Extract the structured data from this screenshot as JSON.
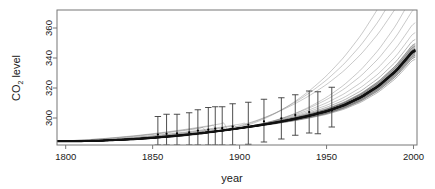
{
  "chart_data": {
    "type": "line",
    "title": "",
    "subtitle": "",
    "xlabel": "year",
    "ylabel": "CO2 level",
    "ylabel_parts": {
      "pre": "CO",
      "sub": "2",
      "post": " level"
    },
    "xlim": [
      1795,
      2002
    ],
    "ylim": [
      282,
      372
    ],
    "grid": false,
    "legend": null,
    "xticks": [
      1800,
      1850,
      1900,
      1950,
      2000
    ],
    "xtick_labels": [
      "1800",
      "1850",
      "1900",
      "1950",
      "2000"
    ],
    "yticks": [
      300,
      320,
      340,
      360
    ],
    "ytick_labels": [
      "300",
      "320",
      "340",
      "360"
    ],
    "colors": {
      "fit_curve": "#111111",
      "posterior_curves": "#7a7a7a",
      "errorbar": "#3a3a3a",
      "axis": "#777777",
      "text": "#1a1a1a",
      "background": "#ffffff"
    },
    "series": [
      {
        "name": "mean trend",
        "style": "thick-black-line",
        "x": [
          1800,
          1810,
          1820,
          1830,
          1840,
          1850,
          1860,
          1870,
          1880,
          1890,
          1900,
          1910,
          1920,
          1930,
          1940,
          1950,
          1960,
          1970,
          1980,
          1990,
          2000
        ],
        "values": [
          284.5,
          284.6,
          284.9,
          285.4,
          286.0,
          286.8,
          287.8,
          288.9,
          290.2,
          291.6,
          293.2,
          294.9,
          296.8,
          299.0,
          301.5,
          304.5,
          308.5,
          314.0,
          321.5,
          331.5,
          345.0
        ]
      },
      {
        "name": "posterior sample curves",
        "style": "thin-grey-lines",
        "count": 18,
        "spread_start_year": 1900,
        "x": [
          1800,
          1850,
          1900,
          1930,
          1950,
          1970,
          1985,
          1995,
          2000
        ],
        "upper_envelope": [
          284.8,
          287.6,
          294.6,
          301.8,
          307.5,
          320.0,
          340.0,
          365.0,
          378.0
        ],
        "lower_envelope": [
          284.2,
          286.2,
          292.4,
          297.8,
          302.8,
          312.0,
          319.5,
          340.0,
          347.0
        ]
      }
    ],
    "errorbars": [
      {
        "year": 1853,
        "value": 289.0,
        "low": 282.0,
        "high": 301.0
      },
      {
        "year": 1858,
        "value": 289.5,
        "low": 282.0,
        "high": 302.5
      },
      {
        "year": 1864,
        "value": 289.8,
        "low": 282.0,
        "high": 302.5
      },
      {
        "year": 1871,
        "value": 290.5,
        "low": 282.0,
        "high": 303.5
      },
      {
        "year": 1876,
        "value": 291.6,
        "low": 282.0,
        "high": 305.5
      },
      {
        "year": 1882,
        "value": 292.2,
        "low": 282.0,
        "high": 307.0
      },
      {
        "year": 1886,
        "value": 292.9,
        "low": 282.0,
        "high": 307.5
      },
      {
        "year": 1890,
        "value": 293.2,
        "low": 282.0,
        "high": 307.5
      },
      {
        "year": 1896,
        "value": 294.2,
        "low": 282.0,
        "high": 309.5
      },
      {
        "year": 1905,
        "value": 295.5,
        "low": 282.5,
        "high": 310.5
      },
      {
        "year": 1914,
        "value": 297.8,
        "low": 284.0,
        "high": 312.5
      },
      {
        "year": 1924,
        "value": 299.8,
        "low": 286.0,
        "high": 313.5
      },
      {
        "year": 1932,
        "value": 302.0,
        "low": 288.5,
        "high": 315.5
      },
      {
        "year": 1940,
        "value": 304.0,
        "low": 290.0,
        "high": 318.0
      },
      {
        "year": 1945,
        "value": 303.5,
        "low": 289.5,
        "high": 317.5
      },
      {
        "year": 1953,
        "value": 305.0,
        "low": 294.0,
        "high": 320.5
      }
    ]
  }
}
